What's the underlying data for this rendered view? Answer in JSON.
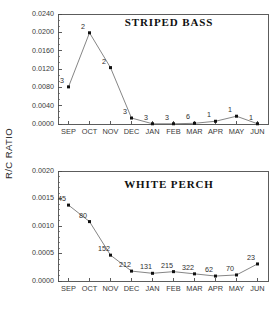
{
  "figure": {
    "shared_ylabel": "R/C RATIO",
    "background_color": "#ffffff",
    "frame_color": "#4a4a4a",
    "line_color": "#6f6f6f",
    "marker_color": "#111111"
  },
  "chart_data": [
    {
      "type": "line",
      "title": "STRIPED BASS",
      "xlabel": "",
      "ylabel": "R/C RATIO",
      "categories": [
        "SEP",
        "OCT",
        "NOV",
        "DEC",
        "JAN",
        "FEB",
        "MAR",
        "APR",
        "MAY",
        "JUN"
      ],
      "values": [
        0.0081,
        0.0199,
        0.0123,
        0.0013,
        5e-05,
        5e-05,
        0.00015,
        0.0006,
        0.0017,
        5e-05
      ],
      "point_labels": [
        "3",
        "2",
        "2",
        "3",
        "3",
        "3",
        "6",
        "1",
        "1",
        "1"
      ],
      "ylim": [
        0.0,
        0.024
      ],
      "yticks": [
        0.0,
        0.004,
        0.008,
        0.012,
        0.016,
        0.02,
        0.024
      ],
      "ytick_labels": [
        "0.0000",
        "0.0040",
        "0.0080",
        "0.0120",
        "0.0160",
        "0.0200",
        "0.0240"
      ],
      "minor_ticks_per_interval": 2,
      "grid": false,
      "legend": "none"
    },
    {
      "type": "line",
      "title": "WHITE PERCH",
      "xlabel": "",
      "ylabel": "R/C RATIO",
      "categories": [
        "SEP",
        "OCT",
        "NOV",
        "DEC",
        "JAN",
        "FEB",
        "MAR",
        "APR",
        "MAY",
        "JUN"
      ],
      "values": [
        0.00138,
        0.00108,
        0.00047,
        0.00018,
        0.00014,
        0.00017,
        0.00013,
        9e-05,
        0.00011,
        0.00031
      ],
      "point_labels": [
        "45",
        "80",
        "152",
        "212",
        "131",
        "215",
        "322",
        "62",
        "70",
        "23"
      ],
      "ylim": [
        0.0,
        0.002
      ],
      "yticks": [
        0.0,
        0.0005,
        0.001,
        0.0015,
        0.002
      ],
      "ytick_labels": [
        "0.0000",
        "0.0005",
        "0.0010",
        "0.0015",
        "0.0020"
      ],
      "minor_ticks_per_interval": 4,
      "grid": false,
      "legend": "none"
    }
  ]
}
